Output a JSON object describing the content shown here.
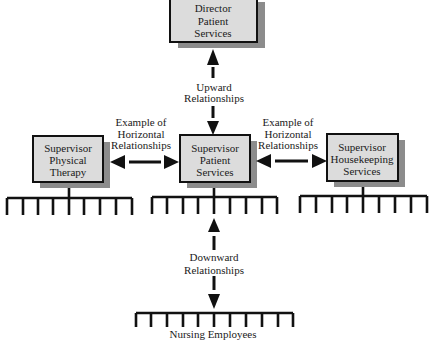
{
  "diagram": {
    "colors": {
      "box_fill": "#dcdcdc",
      "box_shadow": "#8c8c8c",
      "line": "#111111",
      "text": "#1a1a1a"
    },
    "nodes": {
      "director": {
        "lines": [
          "Director",
          "Patient",
          "Services"
        ]
      },
      "physical_therapy": {
        "lines": [
          "Supervisor",
          "Physical",
          "Therapy"
        ],
        "subordinate_ticks": 9
      },
      "patient_services": {
        "lines": [
          "Supervisor",
          "Patient",
          "Services"
        ],
        "subordinate_ticks": 9
      },
      "housekeeping": {
        "lines": [
          "Supervisor",
          "Housekeeping",
          "Services"
        ],
        "subordinate_ticks": 9
      },
      "nursing": {
        "label": "Nursing Employees",
        "ticks": 11
      }
    },
    "edges": {
      "upward": {
        "from": "patient_services",
        "to": "director",
        "lines": [
          "Upward",
          "Relationships"
        ],
        "bidirectional": true
      },
      "horizontal_left": {
        "from": "patient_services",
        "to": "physical_therapy",
        "lines": [
          "Example of",
          "Horizontal",
          "Relationships"
        ],
        "bidirectional": true
      },
      "horizontal_right": {
        "from": "patient_services",
        "to": "housekeeping",
        "lines": [
          "Example of",
          "Horizontal",
          "Relationships"
        ],
        "bidirectional": true
      },
      "downward": {
        "from": "patient_services",
        "to": "nursing",
        "lines": [
          "Downward",
          "Relationships"
        ],
        "bidirectional": true
      }
    }
  }
}
